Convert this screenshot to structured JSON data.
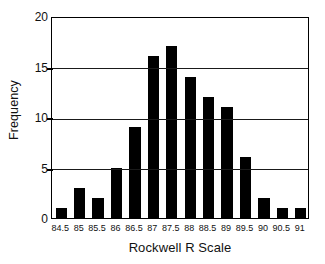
{
  "chart_data": {
    "type": "bar",
    "title": "",
    "xlabel": "Rockwell R Scale",
    "ylabel": "Frequency",
    "categories": [
      "84.5",
      "85",
      "85.5",
      "86",
      "86.5",
      "87",
      "87.5",
      "88",
      "88.5",
      "89",
      "89.5",
      "90",
      "90.5",
      "91"
    ],
    "values": [
      1,
      3,
      2,
      5,
      9,
      16,
      17,
      14,
      12,
      11,
      6,
      2,
      1,
      1
    ],
    "ylim": [
      0,
      20
    ],
    "yticks": [
      "0",
      "5",
      "10",
      "15",
      "20"
    ],
    "ytick_values": [
      0,
      5,
      10,
      15,
      20
    ],
    "grid": "horizontal",
    "legend": "none",
    "bar_color": "#000000",
    "background_color": "#ffffff"
  }
}
